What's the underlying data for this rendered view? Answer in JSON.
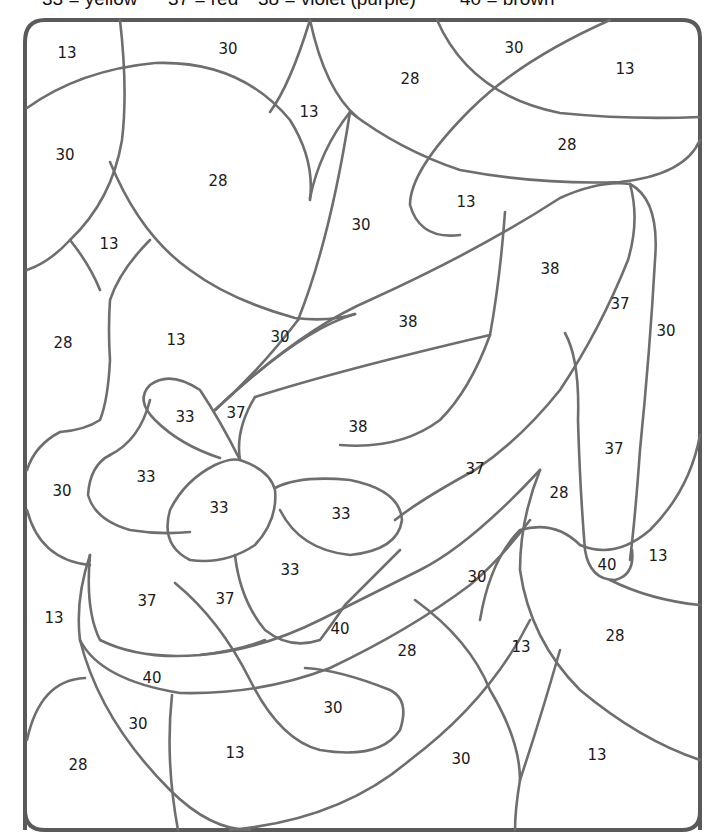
{
  "legend": {
    "keys": [
      {
        "number": "33",
        "color_name": "yellow",
        "text": "33 = yellow",
        "hex": "#f5d42a"
      },
      {
        "number": "37",
        "color_name": "red",
        "text": "37 = red",
        "hex": "#d93030"
      },
      {
        "number": "38",
        "color_name": "violet (purple)",
        "text": "38 = violet (purple)",
        "hex": "#8a4fb0"
      },
      {
        "number": "40",
        "color_name": "brown",
        "text": "40 = brown",
        "hex": "#8b5a2b"
      }
    ]
  },
  "picture": {
    "subject": "high-heeled shoe with bow",
    "regions": [
      {
        "label": "13"
      },
      {
        "label": "30"
      },
      {
        "label": "30"
      },
      {
        "label": "13"
      },
      {
        "label": "28"
      },
      {
        "label": "13"
      },
      {
        "label": "30"
      },
      {
        "label": "28"
      },
      {
        "label": "28"
      },
      {
        "label": "13"
      },
      {
        "label": "30"
      },
      {
        "label": "13"
      },
      {
        "label": "38"
      },
      {
        "label": "37"
      },
      {
        "label": "30"
      },
      {
        "label": "28"
      },
      {
        "label": "13"
      },
      {
        "label": "30"
      },
      {
        "label": "38"
      },
      {
        "label": "33"
      },
      {
        "label": "37"
      },
      {
        "label": "38"
      },
      {
        "label": "37"
      },
      {
        "label": "33"
      },
      {
        "label": "30"
      },
      {
        "label": "33"
      },
      {
        "label": "37"
      },
      {
        "label": "28"
      },
      {
        "label": "33"
      },
      {
        "label": "33"
      },
      {
        "label": "40"
      },
      {
        "label": "13"
      },
      {
        "label": "13"
      },
      {
        "label": "37"
      },
      {
        "label": "37"
      },
      {
        "label": "30"
      },
      {
        "label": "40"
      },
      {
        "label": "28"
      },
      {
        "label": "13"
      },
      {
        "label": "28"
      },
      {
        "label": "40"
      },
      {
        "label": "30"
      },
      {
        "label": "30"
      },
      {
        "label": "28"
      },
      {
        "label": "13"
      },
      {
        "label": "30"
      },
      {
        "label": "13"
      }
    ]
  }
}
